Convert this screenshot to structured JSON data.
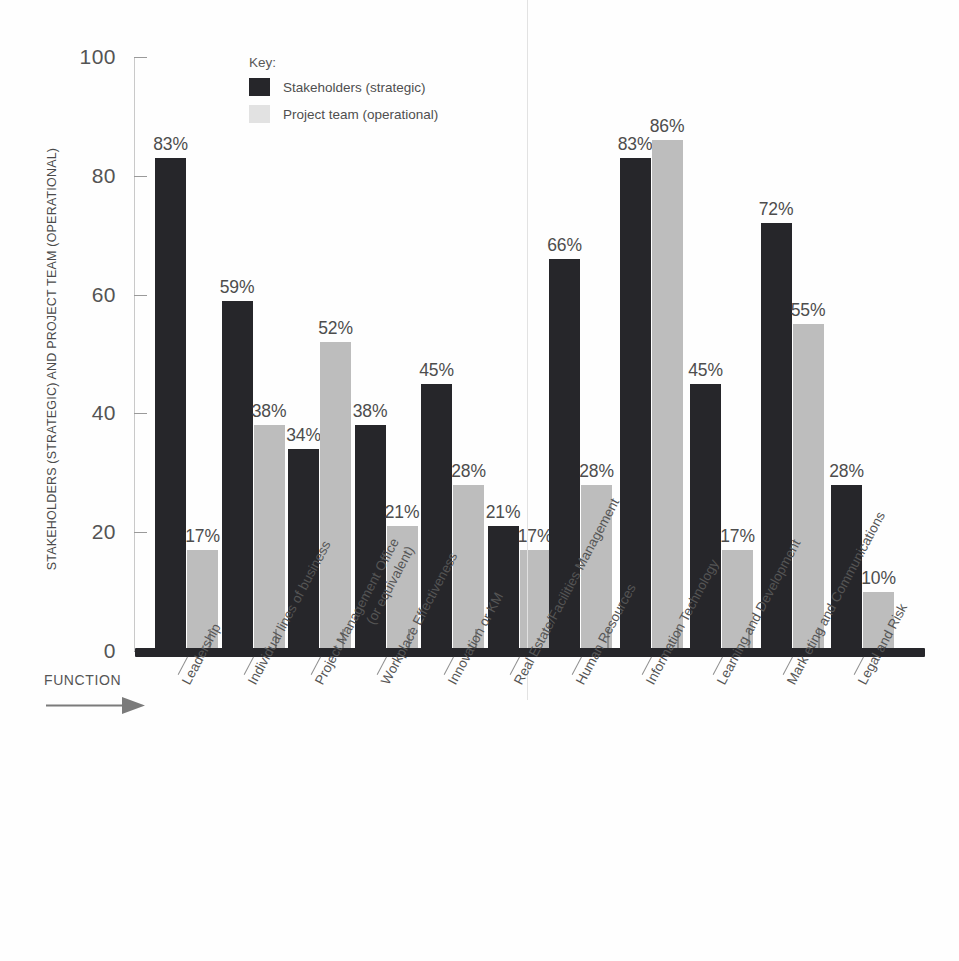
{
  "chart_data": {
    "type": "bar",
    "title": "",
    "subtitle": "",
    "xlabel": "FUNCTION",
    "ylabel": "STAKEHOLDERS (STRATEGIC) AND PROJECT TEAM (OPERATIONAL)",
    "ylim": [
      0,
      100
    ],
    "yticks": [
      0,
      20,
      40,
      60,
      80,
      100
    ],
    "grid": false,
    "legend_position": "top-left-inside",
    "legend_title": "Key:",
    "value_suffix": "%",
    "categories": [
      "Leadership",
      "Individual lines of business",
      "Project Management Office (or equivalent)",
      "Workplace Effectiveness",
      "Innovation or KM",
      "Real Estate/Facilities Management",
      "Human Resources",
      "Information Technology",
      "Learning and Development",
      "Mark eting and Communications",
      "Legal and Risk"
    ],
    "category_lines": [
      [
        "Leadership"
      ],
      [
        "Individual lines of business"
      ],
      [
        "Project Management Office",
        "(or equivalent)"
      ],
      [
        "Workplace Effectiveness"
      ],
      [
        "Innovation or KM"
      ],
      [
        "Real Estate/Facilities Management"
      ],
      [
        "Human Resources"
      ],
      [
        "Information Technology"
      ],
      [
        "Learning and Development"
      ],
      [
        "Mark eting and Communications"
      ],
      [
        "Legal and Risk"
      ]
    ],
    "series": [
      {
        "name": "Stakeholders (strategic)",
        "color": "#26262a",
        "values": [
          83,
          59,
          34,
          38,
          45,
          21,
          66,
          83,
          45,
          72,
          28
        ],
        "labels": [
          "83%",
          "59%",
          "34%",
          "38%",
          "45%",
          "21%",
          "66%",
          "83%",
          "45%",
          "72%",
          "28%"
        ]
      },
      {
        "name": "Project team (operational)",
        "color": "#bdbdbd",
        "values": [
          17,
          38,
          52,
          21,
          28,
          17,
          28,
          86,
          17,
          55,
          10
        ],
        "labels": [
          "17%",
          "38%",
          "52%",
          "21%",
          "28%",
          "17%",
          "28%",
          "86%",
          "17%",
          "55%",
          "10%"
        ]
      }
    ],
    "group_divider_after_category_index": 5
  },
  "axis": {
    "y_tick_labels": [
      "100",
      "80",
      "60",
      "40",
      "20",
      "0"
    ],
    "y_title": "STAKEHOLDERS (STRATEGIC) AND PROJECT TEAM (OPERATIONAL)"
  },
  "legend": {
    "title": "Key:",
    "items": [
      {
        "label": "Stakeholders (strategic)",
        "color": "#26262a"
      },
      {
        "label": "Project team (operational)",
        "color": "#e2e2e2"
      }
    ]
  },
  "annotation": {
    "function_label": "FUNCTION",
    "arrow_icon": "arrow-right-icon"
  },
  "colors": {
    "background": "#fefefe",
    "series_dark": "#26262a",
    "series_light": "#bdbdbd",
    "axis": "#c9c9c9",
    "text": "#4f4f4f",
    "baseline": "#26262a"
  }
}
